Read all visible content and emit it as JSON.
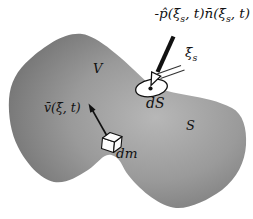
{
  "figure": {
    "force_label": {
      "seg1": "-p̂(ξ̄",
      "sub1": "s",
      "seg2": ", t)n̄(ξ̄",
      "sub2": "s",
      "seg3": ", t)"
    },
    "xi_label": {
      "seg1": "ξ̄",
      "sub1": "s"
    },
    "ds_label": "dS",
    "volume_label": "V",
    "surface_label": "S",
    "velocity_label": "v̄(ξ̄, t)",
    "dm_label": "dm"
  },
  "colors": {
    "background": "#ffffff",
    "blob_center": "#b7b7b7",
    "blob_mid": "#9a9a9a",
    "blob_edge": "#6d6d6d",
    "ink": "#111111",
    "surface_element_fill": "#ffffff",
    "cube_face_fill": "#fdfdfd"
  }
}
